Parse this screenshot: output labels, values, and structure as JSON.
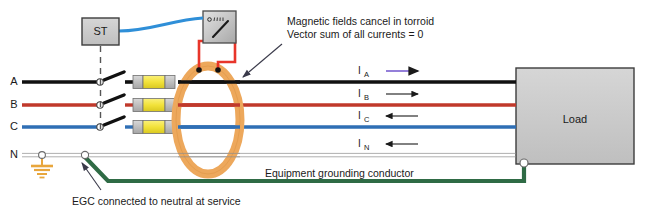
{
  "diagram": {
    "shunt_trip": {
      "label": "ST",
      "name": "shunt-trip-device"
    },
    "meter": {
      "name": "ground-fault-relay-meter"
    },
    "toroid": {
      "name": "toroid-current-transformer"
    },
    "load": {
      "label": "Load"
    },
    "phases": [
      {
        "id": "A",
        "label": "A",
        "color": "#111111"
      },
      {
        "id": "B",
        "label": "B",
        "color": "#c0392b"
      },
      {
        "id": "C",
        "label": "C",
        "color": "#2f6fb5"
      },
      {
        "id": "N",
        "label": "N",
        "color": "#c9c9c9"
      }
    ],
    "currents": [
      {
        "label": "I",
        "sub": "A",
        "direction": "right",
        "color": "#7a5fd0"
      },
      {
        "label": "I",
        "sub": "B",
        "direction": "right",
        "color": "#1a1a1a"
      },
      {
        "label": "I",
        "sub": "C",
        "direction": "left",
        "color": "#1a1a1a"
      },
      {
        "label": "I",
        "sub": "N",
        "direction": "left",
        "color": "#1a1a1a"
      }
    ],
    "annotations": {
      "torroid_line1": "Magnetic fields cancel in torroid",
      "torroid_line2": "Vector sum of all currents = 0",
      "egc_label": "Equipment grounding conductor",
      "egc_caption": "EGC connected to neutral at service"
    },
    "colors": {
      "phase_a": "#111111",
      "phase_b": "#c0392b",
      "phase_c": "#2f6fb5",
      "neutral": "#c9c9c9",
      "egc_green": "#2f6b45",
      "toroid": "#eda85c",
      "ct_wire_red": "#e8352a",
      "control_blue": "#2f8fd8",
      "fuse_yellow": "#f2e23a",
      "box_gray": "#c9c9c9",
      "ground_symbol": "#e8a63c"
    }
  }
}
